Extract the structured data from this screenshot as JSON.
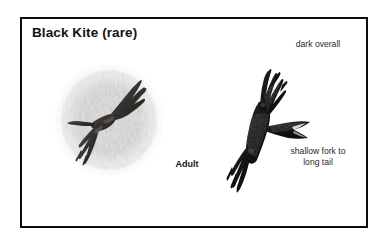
{
  "plate": {
    "title": "Black Kite (rare)",
    "frame_color": "#0c0c0c",
    "background_color": "#ffffff"
  },
  "figures": [
    {
      "id": "adult-soaring",
      "label": "Adult",
      "description": "soaring kite seen from below over mottled grey habitat texture",
      "has_background_texture": true,
      "plumage_color": "#2e2c2a"
    },
    {
      "id": "flight-dark",
      "label": "",
      "description": "dark kite banking in flight with fingered primaries and forked tail",
      "has_background_texture": false,
      "plumage_color": "#171616"
    }
  ],
  "callouts": [
    {
      "id": "dark-overall",
      "text": "dark overall"
    },
    {
      "id": "shallow-fork",
      "text": "shallow fork to\nlong tail"
    }
  ],
  "labels": {
    "adult": "Adult"
  }
}
